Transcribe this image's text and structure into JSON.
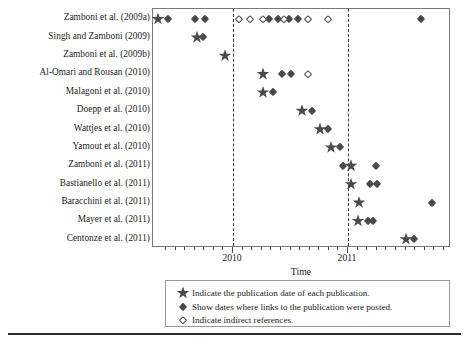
{
  "chart_data": {
    "type": "scatter",
    "title": "",
    "xlabel": "Time",
    "ylabel": "",
    "grid": false,
    "legend_position": "below-plot",
    "xlim": [
      "2009-06",
      "2011-10"
    ],
    "x_major_ticks": [
      "2010",
      "2011"
    ],
    "x_minor_tick_count": 28,
    "categories": [
      "Zamboni et al. (2009a)",
      "Singh and Zamboni (2009)",
      "Zamboni et al. (2009b)",
      "Al-Omari and Rousan (2010)",
      "Malagoni et al. (2010)",
      "Doepp et al. (2010)",
      "Wattjes et al. (2010)",
      "Yamout et al. (2010)",
      "Zamboni et al. (2011)",
      "Bastianello et al. (2011)",
      "Baracchini et al. (2011)",
      "Mayer et al. (2011)",
      "Centonze et al. (2011)"
    ],
    "series": [
      {
        "name": "publication-date",
        "marker": "filled-star",
        "points": [
          {
            "row": 0,
            "x": 157
          },
          {
            "row": 1,
            "x": 196
          },
          {
            "row": 2,
            "x": 224
          },
          {
            "row": 3,
            "x": 262
          },
          {
            "row": 4,
            "x": 262
          },
          {
            "row": 5,
            "x": 301
          },
          {
            "row": 6,
            "x": 319
          },
          {
            "row": 7,
            "x": 330
          },
          {
            "row": 8,
            "x": 350
          },
          {
            "row": 9,
            "x": 350
          },
          {
            "row": 10,
            "x": 358
          },
          {
            "row": 11,
            "x": 357
          },
          {
            "row": 12,
            "x": 405
          }
        ]
      },
      {
        "name": "link-posted-date",
        "marker": "filled-diamond",
        "points": [
          {
            "row": 0,
            "x": 167
          },
          {
            "row": 0,
            "x": 194
          },
          {
            "row": 0,
            "x": 204
          },
          {
            "row": 0,
            "x": 268
          },
          {
            "row": 0,
            "x": 277
          },
          {
            "row": 0,
            "x": 288
          },
          {
            "row": 0,
            "x": 297
          },
          {
            "row": 0,
            "x": 420
          },
          {
            "row": 1,
            "x": 202
          },
          {
            "row": 3,
            "x": 281
          },
          {
            "row": 3,
            "x": 290
          },
          {
            "row": 4,
            "x": 272
          },
          {
            "row": 5,
            "x": 311
          },
          {
            "row": 6,
            "x": 327
          },
          {
            "row": 7,
            "x": 339
          },
          {
            "row": 8,
            "x": 342
          },
          {
            "row": 8,
            "x": 375
          },
          {
            "row": 9,
            "x": 369
          },
          {
            "row": 9,
            "x": 376
          },
          {
            "row": 10,
            "x": 431
          },
          {
            "row": 11,
            "x": 367
          },
          {
            "row": 11,
            "x": 372
          },
          {
            "row": 12,
            "x": 413
          }
        ]
      },
      {
        "name": "indirect-reference",
        "marker": "open-diamond",
        "points": [
          {
            "row": 0,
            "x": 238
          },
          {
            "row": 0,
            "x": 249
          },
          {
            "row": 0,
            "x": 262
          },
          {
            "row": 0,
            "x": 283
          },
          {
            "row": 0,
            "x": 307
          },
          {
            "row": 0,
            "x": 327
          },
          {
            "row": 3,
            "x": 307
          }
        ]
      }
    ],
    "x_tick_labels": [
      {
        "label": "2010",
        "x": 232
      },
      {
        "label": "2011",
        "x": 347
      }
    ],
    "reference_lines": [
      {
        "label": "2010",
        "x": 232,
        "style": "dashed"
      },
      {
        "label": "2011",
        "x": 347,
        "style": "dashed"
      }
    ]
  },
  "legend": {
    "entries": [
      {
        "marker": "filled-star",
        "text": "Indicate the publication date of each publication."
      },
      {
        "marker": "filled-diamond",
        "text": "Show dates where links to the publication were posted."
      },
      {
        "marker": "open-diamond",
        "text": "Indicate indirect references."
      }
    ]
  }
}
